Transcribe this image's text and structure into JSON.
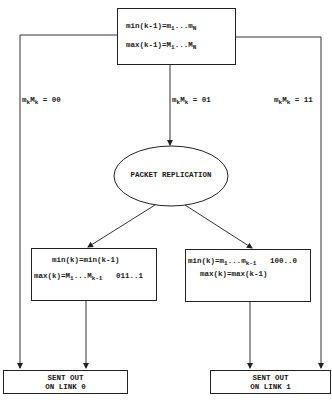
{
  "diagram": {
    "top_box": {
      "line1": {
        "prefix": "min(k-1)=m",
        "sub1": "1",
        "mid": "...m",
        "sub2": "N"
      },
      "line2": {
        "prefix": "max(k-1)=M",
        "sub1": "1",
        "mid": "...M",
        "sub2": "N"
      }
    },
    "branch_labels": {
      "left": {
        "a": "m",
        "asub": "k",
        "b": "M",
        "bsub": "k",
        "value": " = 00"
      },
      "middle": {
        "a": "m",
        "asub": "k",
        "b": "M",
        "bsub": "k",
        "value": " = 01"
      },
      "right": {
        "a": "m",
        "asub": "k",
        "b": "M",
        "bsub": "k",
        "value": " = 11"
      }
    },
    "ellipse": {
      "label": "PACKET REPLICATION"
    },
    "left_box": {
      "line1": "min(k)=min(k-1)",
      "line2": {
        "prefix": "max(k)=M",
        "sub1": "1",
        "mid": "...M",
        "sub2": "k-1",
        "suffix": "011..1"
      }
    },
    "right_box": {
      "line1": {
        "prefix": "min(k)=m",
        "sub1": "1",
        "mid": "...m",
        "sub2": "k-1",
        "suffix": "100..0"
      },
      "line2": "max(k)=max(k-1)"
    },
    "output_left": {
      "line1": "SENT OUT",
      "line2": "ON LINK 0"
    },
    "output_right": {
      "line1": "SENT OUT",
      "line2": "ON LINK 1"
    }
  }
}
